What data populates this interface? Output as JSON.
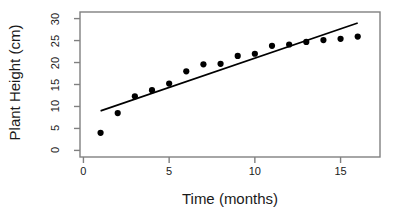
{
  "chart_data": {
    "type": "scatter",
    "title": "",
    "xlabel": "Time (months)",
    "ylabel": "Plant Height (cm)",
    "x": [
      1,
      2,
      3,
      4,
      5,
      6,
      7,
      8,
      9,
      10,
      11,
      12,
      13,
      14,
      15,
      16
    ],
    "values": [
      4.0,
      8.5,
      12.3,
      13.7,
      15.2,
      18.0,
      19.6,
      19.7,
      21.5,
      22.0,
      23.8,
      24.1,
      24.7,
      25.1,
      25.4,
      25.9
    ],
    "series": [
      {
        "name": "Plant Height",
        "type": "scatter",
        "marker": "filled-circle",
        "color": "#000000",
        "values": [
          4.0,
          8.5,
          12.3,
          13.7,
          15.2,
          18.0,
          19.6,
          19.7,
          21.5,
          22.0,
          23.8,
          24.1,
          24.7,
          25.1,
          25.4,
          25.9
        ]
      },
      {
        "name": "Fitted line",
        "type": "line",
        "color": "#000000",
        "x_endpoints": [
          1,
          16
        ],
        "y_endpoints": [
          9.0,
          29.0
        ]
      }
    ],
    "xlim": [
      -0.2,
      17.3
    ],
    "ylim": [
      -1.5,
      31.5
    ],
    "xticks": [
      0,
      5,
      10,
      15
    ],
    "xtick_labels": [
      "0",
      "5",
      "10",
      "15"
    ],
    "yticks": [
      0,
      5,
      10,
      15,
      20,
      25,
      30
    ],
    "ytick_labels": [
      "0",
      "5",
      "10",
      "15",
      "20",
      "25",
      "30"
    ],
    "grid": false,
    "legend": "none",
    "frame": true,
    "frame_color": "#808080",
    "point_color": "#000000",
    "line_color": "#000000"
  }
}
